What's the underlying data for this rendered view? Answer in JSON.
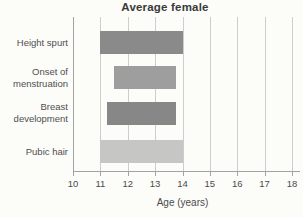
{
  "chart_data": {
    "type": "bar",
    "orientation": "horizontal",
    "title": "Average female",
    "xlabel": "Age (years)",
    "xlim": [
      10,
      18
    ],
    "x_ticks": [
      10,
      11,
      12,
      13,
      14,
      15,
      16,
      17,
      18
    ],
    "grid": "vertical gridlines at each year, no horizontal gridlines",
    "legend": "none",
    "categories": [
      {
        "lines": [
          "Height spurt"
        ]
      },
      {
        "lines": [
          "Onset of",
          "menstruation"
        ]
      },
      {
        "lines": [
          "Breast",
          "development"
        ]
      },
      {
        "lines": [
          "Pubic hair"
        ]
      }
    ],
    "bars": [
      {
        "label": "Height spurt",
        "start": 11.0,
        "end": 14.0,
        "color": "#8a8a8a"
      },
      {
        "label": "Onset of menstruation",
        "start": 11.5,
        "end": 13.75,
        "color": "#9e9e9e"
      },
      {
        "label": "Breast development",
        "start": 11.25,
        "end": 13.75,
        "color": "#878787"
      },
      {
        "label": "Pubic hair",
        "start": 11.0,
        "end": 14.0,
        "color": "#c6c6c4"
      }
    ],
    "colors": {
      "background": "#fcfcf9",
      "axis": "#a3a3a3",
      "gridline": "#cdcdcb",
      "title_text": "#3a3a3a",
      "label_text": "#4f4f4f",
      "tick_text": "#4b4b4b"
    }
  }
}
